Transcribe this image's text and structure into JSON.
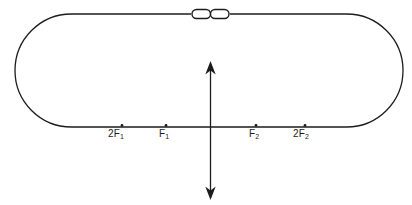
{
  "figure": {
    "background_color": "#ffffff",
    "line_color": "#1c1c1c",
    "shapes": {
      "loop": "stadium-loop-outline",
      "top_links": "double-link-shape",
      "lens": "vertical-double-arrow",
      "axis_marks": "tick-dots"
    }
  },
  "axis": {
    "points": [
      {
        "name": "2F1",
        "base": "2F",
        "subscript": "1"
      },
      {
        "name": "F1",
        "base": "F",
        "subscript": "1"
      },
      {
        "name": "F2",
        "base": "F",
        "subscript": "2"
      },
      {
        "name": "2F2",
        "base": "2F",
        "subscript": "2"
      }
    ]
  }
}
